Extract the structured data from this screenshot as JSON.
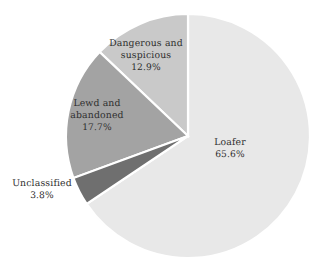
{
  "chart_data": {
    "type": "pie",
    "title": "",
    "subtitle": "",
    "xlabel": "",
    "ylabel": "",
    "legend_position": "none",
    "labels_inline": true,
    "units": "percent",
    "total": 100.0,
    "start_angle_deg": 0,
    "categories": [
      "Loafer",
      "Dangerous and suspicious",
      "Lewd and abandoned",
      "Unclassified"
    ],
    "values": [
      65.6,
      12.9,
      17.7,
      3.8
    ],
    "slices": [
      {
        "label": "Loafer",
        "label_line1": "Loafer",
        "value": 65.6,
        "value_text": "65.6%",
        "color": "#e8e8e8",
        "direction": "clockwise",
        "order": 1
      },
      {
        "label": "Dangerous and suspicious",
        "label_line1": "Dangerous and",
        "label_line2": "suspicious",
        "value": 12.9,
        "value_text": "12.9%",
        "color": "#c9c9c9",
        "direction": "counterclockwise",
        "order": 2
      },
      {
        "label": "Lewd and abandoned",
        "label_line1": "Lewd and",
        "label_line2": "abandoned",
        "value": 17.7,
        "value_text": "17.7%",
        "color": "#a3a3a3",
        "direction": "counterclockwise",
        "order": 3
      },
      {
        "label": "Unclassified",
        "label_line1": "Unclassified",
        "value": 3.8,
        "value_text": "3.8%",
        "color": "#6f6f6f",
        "direction": "counterclockwise",
        "order": 4
      }
    ],
    "geometry": {
      "center_x": 188,
      "center_y": 136,
      "radius": 122
    },
    "style": {
      "background": "#ffffff",
      "separator_color": "#ffffff",
      "label_text_color": "#2e2e2e"
    }
  }
}
